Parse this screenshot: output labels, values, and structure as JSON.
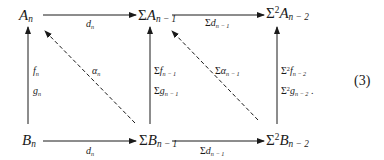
{
  "diagram": {
    "type": "commutative-diagram",
    "equation_number": "(3)",
    "nodes": {
      "A_n": {
        "base": "A",
        "prefix": "",
        "sup": "",
        "sub": "n"
      },
      "SigmaA": {
        "base": "A",
        "prefix": "Σ",
        "sup": "",
        "sub": "n − 1"
      },
      "Sigma2A": {
        "base": "A",
        "prefix": "Σ",
        "sup": "2",
        "sub": "n − 2"
      },
      "B_n": {
        "base": "B",
        "prefix": "",
        "sup": "",
        "sub": "n"
      },
      "SigmaB": {
        "base": "B",
        "prefix": "Σ",
        "sup": "",
        "sub": "n − 1"
      },
      "Sigma2B": {
        "base": "B",
        "prefix": "Σ",
        "sup": "2",
        "sub": "n − 2"
      }
    },
    "edges": {
      "top_left": {
        "prefix": "",
        "sym": "d",
        "sub": "n"
      },
      "top_right": {
        "prefix": "Σ",
        "sym": "d",
        "sub": "n − 1"
      },
      "bottom_left": {
        "prefix": "",
        "sym": "d",
        "sub": "n"
      },
      "bottom_right": {
        "prefix": "Σ",
        "sym": "d",
        "sub": "n − 1"
      },
      "left_f": {
        "prefix": "",
        "sym": "f",
        "sub": "n"
      },
      "left_g": {
        "prefix": "",
        "sym": "g",
        "sub": "n"
      },
      "mid_f": {
        "prefix": "Σ",
        "sym": "f",
        "sub": "n − 1"
      },
      "mid_g": {
        "prefix": "Σ",
        "sym": "g",
        "sub": "n − 1"
      },
      "right_f": {
        "prefix": "Σ",
        "sup": "2",
        "sym": "f",
        "sub": "n − 2"
      },
      "right_g": {
        "prefix": "Σ",
        "sup": "2",
        "sym": "g",
        "sub": "n − 2",
        "trail": " ."
      },
      "diag_left": {
        "prefix": "",
        "sym": "α",
        "sub": "n"
      },
      "diag_right": {
        "prefix": "Σ",
        "sym": "α",
        "sub": "n − 1"
      }
    }
  }
}
